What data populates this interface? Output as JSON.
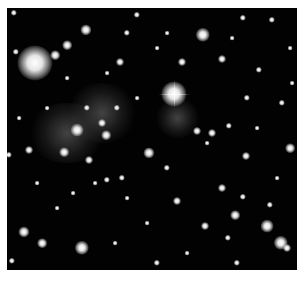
{
  "image": {
    "subject": "galaxy cluster deep-field",
    "background_color": "#ffffff",
    "field_color": "#020202",
    "glows": [
      {
        "x": 95,
        "y": 105,
        "w": 70,
        "h": 60
      },
      {
        "x": 170,
        "y": 110,
        "w": 45,
        "h": 40
      },
      {
        "x": 60,
        "y": 125,
        "w": 80,
        "h": 60
      }
    ],
    "bright_star": {
      "x": 167,
      "y": 86,
      "size": 14
    },
    "stars": [
      {
        "x": 28,
        "y": 55,
        "s": 22
      },
      {
        "x": 79,
        "y": 22,
        "s": 7
      },
      {
        "x": 60,
        "y": 37,
        "s": 6
      },
      {
        "x": 48,
        "y": 47,
        "s": 6
      },
      {
        "x": 7,
        "y": 5,
        "s": 4
      },
      {
        "x": 130,
        "y": 7,
        "s": 4
      },
      {
        "x": 196,
        "y": 27,
        "s": 9
      },
      {
        "x": 236,
        "y": 10,
        "s": 4
      },
      {
        "x": 265,
        "y": 12,
        "s": 4
      },
      {
        "x": 113,
        "y": 54,
        "s": 5
      },
      {
        "x": 9,
        "y": 44,
        "s": 4
      },
      {
        "x": 120,
        "y": 25,
        "s": 4
      },
      {
        "x": 175,
        "y": 54,
        "s": 5
      },
      {
        "x": 215,
        "y": 51,
        "s": 5
      },
      {
        "x": 252,
        "y": 62,
        "s": 4
      },
      {
        "x": 240,
        "y": 90,
        "s": 4
      },
      {
        "x": 275,
        "y": 95,
        "s": 4
      },
      {
        "x": 70,
        "y": 122,
        "s": 8
      },
      {
        "x": 57,
        "y": 144,
        "s": 6
      },
      {
        "x": 99,
        "y": 127,
        "s": 6
      },
      {
        "x": 142,
        "y": 145,
        "s": 7
      },
      {
        "x": 82,
        "y": 152,
        "s": 5
      },
      {
        "x": 22,
        "y": 142,
        "s": 5
      },
      {
        "x": 2,
        "y": 147,
        "s": 4
      },
      {
        "x": 100,
        "y": 172,
        "s": 4
      },
      {
        "x": 115,
        "y": 170,
        "s": 4
      },
      {
        "x": 120,
        "y": 190,
        "s": 3
      },
      {
        "x": 170,
        "y": 193,
        "s": 5
      },
      {
        "x": 215,
        "y": 180,
        "s": 5
      },
      {
        "x": 236,
        "y": 189,
        "s": 4
      },
      {
        "x": 228,
        "y": 207,
        "s": 6
      },
      {
        "x": 198,
        "y": 218,
        "s": 5
      },
      {
        "x": 263,
        "y": 197,
        "s": 4
      },
      {
        "x": 260,
        "y": 218,
        "s": 8
      },
      {
        "x": 283,
        "y": 140,
        "s": 6
      },
      {
        "x": 239,
        "y": 148,
        "s": 5
      },
      {
        "x": 17,
        "y": 224,
        "s": 7
      },
      {
        "x": 35,
        "y": 235,
        "s": 6
      },
      {
        "x": 75,
        "y": 240,
        "s": 9
      },
      {
        "x": 5,
        "y": 253,
        "s": 4
      },
      {
        "x": 150,
        "y": 255,
        "s": 4
      },
      {
        "x": 221,
        "y": 230,
        "s": 4
      },
      {
        "x": 274,
        "y": 235,
        "s": 9
      },
      {
        "x": 280,
        "y": 240,
        "s": 5
      },
      {
        "x": 230,
        "y": 255,
        "s": 4
      },
      {
        "x": 160,
        "y": 160,
        "s": 4
      },
      {
        "x": 190,
        "y": 123,
        "s": 5
      },
      {
        "x": 205,
        "y": 125,
        "s": 5
      },
      {
        "x": 95,
        "y": 115,
        "s": 5
      },
      {
        "x": 110,
        "y": 100,
        "s": 4
      },
      {
        "x": 80,
        "y": 100,
        "s": 4
      },
      {
        "x": 40,
        "y": 100,
        "s": 3
      },
      {
        "x": 130,
        "y": 90,
        "s": 3
      },
      {
        "x": 222,
        "y": 118,
        "s": 4
      },
      {
        "x": 200,
        "y": 135,
        "s": 3
      },
      {
        "x": 88,
        "y": 175,
        "s": 3
      },
      {
        "x": 66,
        "y": 185,
        "s": 3
      },
      {
        "x": 50,
        "y": 200,
        "s": 3
      },
      {
        "x": 140,
        "y": 215,
        "s": 3
      },
      {
        "x": 180,
        "y": 245,
        "s": 3
      },
      {
        "x": 108,
        "y": 235,
        "s": 3
      },
      {
        "x": 250,
        "y": 120,
        "s": 3
      },
      {
        "x": 270,
        "y": 170,
        "s": 3
      },
      {
        "x": 30,
        "y": 175,
        "s": 3
      },
      {
        "x": 12,
        "y": 110,
        "s": 3
      },
      {
        "x": 150,
        "y": 40,
        "s": 3
      },
      {
        "x": 100,
        "y": 65,
        "s": 3
      },
      {
        "x": 60,
        "y": 70,
        "s": 3
      },
      {
        "x": 160,
        "y": 25,
        "s": 3
      },
      {
        "x": 225,
        "y": 30,
        "s": 3
      },
      {
        "x": 283,
        "y": 40,
        "s": 3
      },
      {
        "x": 285,
        "y": 75,
        "s": 3
      }
    ]
  }
}
